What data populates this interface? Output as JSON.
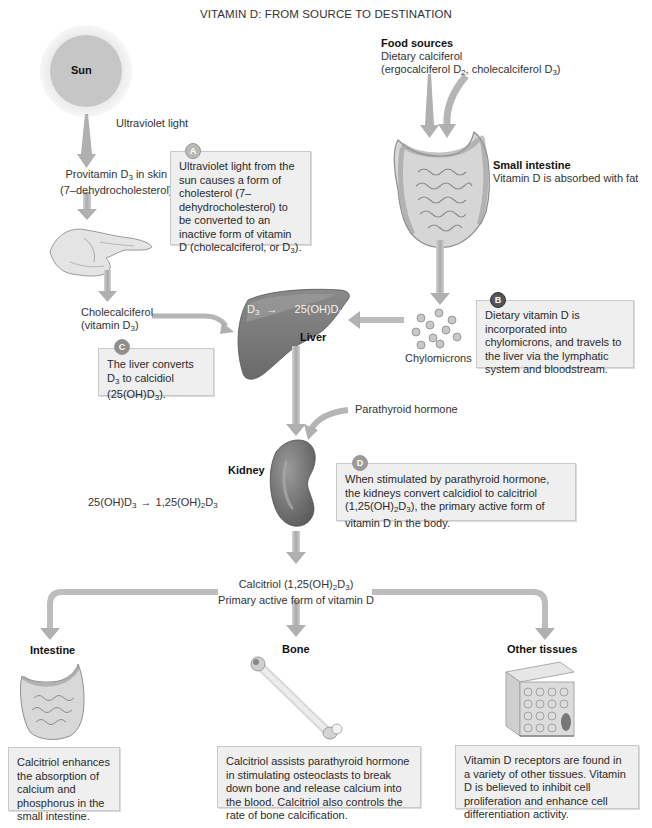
{
  "title": "VITAMIN D: FROM SOURCE TO DESTINATION",
  "colors": {
    "arrow": "#b5b5b5",
    "note_bg": "#efefef",
    "note_border": "#c9c9c9",
    "organ_dark": "#6e6e6e",
    "organ_mid": "#8a8a8a",
    "sun_core": "#c6c6c6",
    "sun_halo": "#ececec"
  },
  "sun": {
    "label": "Sun"
  },
  "uv": {
    "label": "Ultraviolet light"
  },
  "provitamin": {
    "line1": "Provitamin D",
    "line1_sub": "3",
    "line1_suffix": " in skin",
    "line2": "(7–dehydrocholesterol)"
  },
  "cholecalciferol": {
    "line1": "Cholecalciferol",
    "line2": "(vitamin D",
    "line2_sub": "3",
    "line2_suffix": ")"
  },
  "food": {
    "title": "Food sources",
    "line1": "Dietary calciferol",
    "line2_a": "(ergocalciferol D",
    "sub_a": "2",
    "line2_b": ", cholecalciferol D",
    "sub_b": "3",
    "line2_c": ")"
  },
  "small_intestine": {
    "title": "Small intestine",
    "desc": "Vitamin D is absorbed with fat"
  },
  "chylomicrons": {
    "label": "Chylomicrons"
  },
  "liver": {
    "label": "Liver",
    "reaction_left": "D",
    "reaction_left_sub": "3",
    "reaction_right": "25(OH)D",
    "reaction_right_sub": "3"
  },
  "parathyroid": {
    "label": "Parathyroid hormone"
  },
  "kidney": {
    "label": "Kidney",
    "reaction_a": "25(OH)D",
    "reaction_a_sub": "3",
    "reaction_b": "1,25(OH)",
    "reaction_b_sub1": "2",
    "reaction_b_mid": "D",
    "reaction_b_sub2": "3"
  },
  "calcitriol": {
    "line1_a": "Calcitriol (1,25(OH)",
    "sub1": "2",
    "line1_b": "D",
    "sub2": "3",
    "line1_c": ")",
    "line2": "Primary active form of vitamin D"
  },
  "notes": {
    "A": {
      "badge": "A",
      "text_a": "Ultraviolet light from the sun causes a form of cholesterol (7–dehydrocholesterol) to be converted to an inactive form of vitamin D (cholecalciferol, or D",
      "sub": "3",
      "text_b": ")."
    },
    "B": {
      "badge": "B",
      "text": "Dietary vitamin D is incorporated into chylomicrons, and travels to the liver via the lymphatic system and bloodstream."
    },
    "C": {
      "badge": "C",
      "text_a": "The liver converts D",
      "sub1": "3",
      "text_b": " to calcidiol (25(OH)D",
      "sub2": "3",
      "text_c": ")."
    },
    "D": {
      "badge": "D",
      "text_a": "When stimulated by parathyroid hormone, the kidneys convert calcidiol to calcitriol (1,25(OH)",
      "sub1": "2",
      "text_b": "D",
      "sub2": "3",
      "text_c": "), the primary active form of vitamin D in the body."
    }
  },
  "destinations": [
    {
      "title": "Intestine",
      "text": "Calcitriol enhances the absorption of calcium and phosphorus in the small intestine."
    },
    {
      "title": "Bone",
      "text": "Calcitriol assists parathyroid hormone in stimulating osteoclasts to break down bone and release calcium into the blood. Calcitriol also controls the rate of bone calcification."
    },
    {
      "title": "Other tissues",
      "text": "Vitamin D receptors are found in a variety of other tissues. Vitamin D is believed to inhibit cell proliferation and enhance cell differentiation activity."
    }
  ]
}
